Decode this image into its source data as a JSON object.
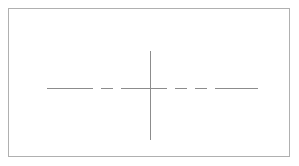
{
  "document": {
    "title": "Centerline Cross Drawing",
    "type": "technical-drawing",
    "background_color": "#ffffff",
    "width": 299,
    "height": 166
  },
  "frame": {
    "name": "drawing-border",
    "stroke_color": "#b0b0b0",
    "stroke_width": 1,
    "x": 8,
    "y": 8,
    "width": 282,
    "height": 149
  },
  "geometry": {
    "center": {
      "x": 150,
      "y": 88
    },
    "horizontal_centerline": {
      "label": "horizontal-centerline",
      "stroke_color": "#8c8c8c",
      "stroke_width": 1,
      "line_style": "dash-dot",
      "x_start": 47,
      "x_end": 258,
      "y": 88,
      "dash_pattern": "46 8 12 8 46 8 12 8 46",
      "segments": [
        {
          "x1": 47,
          "x2": 93
        },
        {
          "x1": 101,
          "x2": 113
        },
        {
          "x1": 121,
          "x2": 167
        },
        {
          "x1": 175,
          "x2": 187
        },
        {
          "x1": 195,
          "x2": 207
        },
        {
          "x1": 215,
          "x2": 258
        }
      ]
    },
    "vertical_centerline": {
      "label": "vertical-centerline",
      "stroke_color": "#8c8c8c",
      "stroke_width": 1,
      "line_style": "solid",
      "x": 150,
      "y_start": 51,
      "y_end": 140
    }
  },
  "annotations": {
    "visible_text": []
  }
}
